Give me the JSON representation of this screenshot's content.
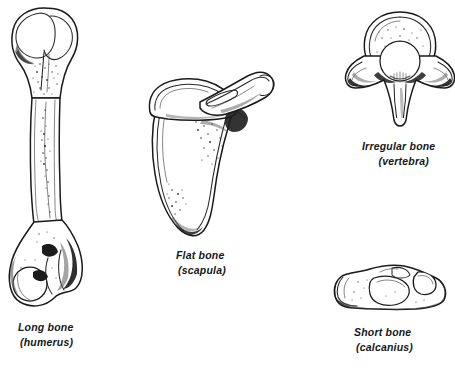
{
  "figure": {
    "background_color": "#ffffff",
    "ink_color": "#1a1a1a",
    "width": 455,
    "height": 368
  },
  "specimens": [
    {
      "id": "long-bone",
      "name": "Long bone",
      "example": "(humerus)",
      "icon": "humerus-bone-icon",
      "position": "left"
    },
    {
      "id": "flat-bone",
      "name": "Flat bone",
      "example": "(scapula)",
      "icon": "scapula-bone-icon",
      "position": "center"
    },
    {
      "id": "irregular-bone",
      "name": "Irregular bone",
      "example": "(vertebra)",
      "icon": "vertebra-bone-icon",
      "position": "top-right"
    },
    {
      "id": "short-bone",
      "name": "Short bone",
      "example": "(calcanius)",
      "icon": "calcaneus-bone-icon",
      "position": "bottom-right"
    }
  ]
}
